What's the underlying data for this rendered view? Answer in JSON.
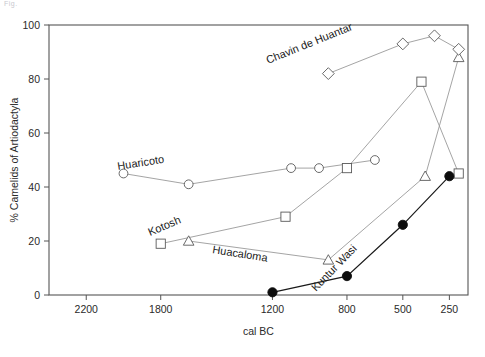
{
  "page": {
    "header_artifact": "Fig."
  },
  "chart_data": {
    "type": "line",
    "title": "",
    "xlabel": "cal BC",
    "ylabel": "% Camelids of Artiodactyla",
    "xlim": [
      2400,
      150
    ],
    "ylim": [
      0,
      100
    ],
    "x_reversed": true,
    "grid": false,
    "legend": "inline-labels",
    "xticks": [
      2200,
      1800,
      1200,
      800,
      500,
      250
    ],
    "xticklabels": [
      "2200",
      "1800",
      "1200",
      "800",
      "500",
      "250"
    ],
    "yticks": [
      0,
      20,
      40,
      60,
      80,
      100
    ],
    "yticklabels": [
      "0",
      "20",
      "40",
      "60",
      "80",
      "100"
    ],
    "series": [
      {
        "name": "Huaricoto",
        "marker": "circle-open",
        "label": "Huaricoto",
        "x": [
          2000,
          1650,
          1100,
          950,
          650
        ],
        "y": [
          45,
          41,
          47,
          47,
          50
        ]
      },
      {
        "name": "Kotosh",
        "marker": "square-open",
        "label": "Kotosh",
        "x": [
          1800,
          1130,
          800,
          400,
          200
        ],
        "y": [
          19,
          29,
          47,
          79,
          45
        ]
      },
      {
        "name": "Huacaloma",
        "marker": "triangle-open",
        "label": "Huacaloma",
        "x": [
          1650,
          900,
          380,
          200
        ],
        "y": [
          20,
          13,
          44,
          88
        ]
      },
      {
        "name": "Chavin de Huantar",
        "marker": "diamond-open",
        "label": "Chavin de Huantar",
        "x": [
          900,
          500,
          330,
          200
        ],
        "y": [
          82,
          93,
          96,
          91
        ]
      },
      {
        "name": "Kuntur Wasi",
        "marker": "circle-filled",
        "label": "Kuntur Wasi",
        "x": [
          1200,
          800,
          500,
          250
        ],
        "y": [
          1,
          7,
          26,
          44
        ]
      }
    ]
  },
  "colors": {
    "line_light": "#9a9a9a",
    "line_dark": "#1a1a1a",
    "marker_open_fill": "#ffffff",
    "marker_open_stroke": "#5a5a5a",
    "marker_filled": "#0d0d0d",
    "axis": "#555555",
    "text": "#1a1a1a",
    "background": "#ffffff"
  }
}
